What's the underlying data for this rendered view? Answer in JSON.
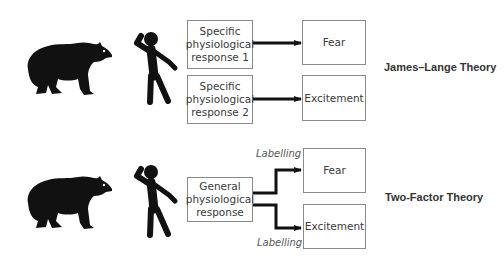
{
  "diagram": {
    "james_lange": {
      "title": "James–Lange Theory",
      "stimulus_icon": "bear-icon",
      "subject_icon": "startled-person-icon",
      "responses": [
        "Specific physiological response 1",
        "Specific physiological response 2"
      ],
      "emotions": [
        "Fear",
        "Excitement"
      ]
    },
    "two_factor": {
      "title": "Two-Factor Theory",
      "stimulus_icon": "bear-icon",
      "subject_icon": "startled-person-icon",
      "response": "General physiological response",
      "labels": [
        "Labelling",
        "Labelling"
      ],
      "emotions": [
        "Fear",
        "Excitement"
      ]
    }
  },
  "colors": {
    "ink": "#111111",
    "box_border": "#8a8a8a",
    "text": "#3a3a3a"
  }
}
